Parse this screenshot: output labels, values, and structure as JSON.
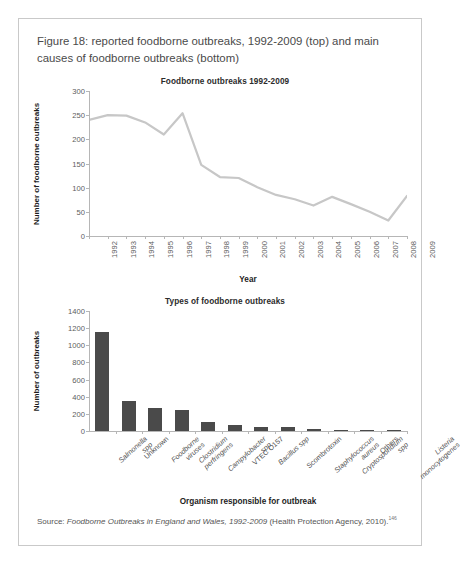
{
  "figure": {
    "caption": "Figure 18: reported foodborne outbreaks, 1992-2009 (top) and main causes of foodborne outbreaks (bottom)",
    "source_label": "Source: ",
    "source_title": "Foodborne Outbreaks in England and Wales, 1992-2009",
    "source_tail": " (Health Protection Agency, 2010).",
    "source_superscript": "146"
  },
  "colors": {
    "line": "#c7c7c7",
    "bar": "#4a4a4a",
    "axis": "#b6b6b6",
    "frame": "#c9c9c9",
    "text": "#3c3c3c"
  },
  "chart_data": [
    {
      "type": "line",
      "title": "Foodborne outbreaks 1992-2009",
      "xlabel": "Year",
      "ylabel": "Number of foodborne outbreaks",
      "ylim": [
        0,
        300
      ],
      "yticks": [
        0,
        50,
        100,
        150,
        200,
        250,
        300
      ],
      "grid": false,
      "legend": "none",
      "categories": [
        "1992",
        "1993",
        "1994",
        "1995",
        "1996",
        "1997",
        "1998",
        "1999",
        "2000",
        "2001",
        "2002",
        "2003",
        "2004",
        "2005",
        "2006",
        "2007",
        "2008",
        "2009"
      ],
      "values": [
        240,
        250,
        249,
        235,
        210,
        254,
        147,
        122,
        120,
        101,
        85,
        76,
        63,
        81,
        66,
        50,
        32,
        83
      ]
    },
    {
      "type": "bar",
      "title": "Types of foodborne outbreaks",
      "xlabel": "Organism responsible for outbreak",
      "ylabel": "Number of  outbreaks",
      "ylim": [
        0,
        1400
      ],
      "yticks": [
        0,
        200,
        400,
        600,
        800,
        1000,
        1200,
        1400
      ],
      "grid": false,
      "legend": "none",
      "categories": [
        "Salmonella spp",
        "Unknown",
        "Foodborne viruses",
        "Clostridium perfringens",
        "Campylobacter spp",
        "VTEC O157",
        "Bacillus spp",
        "Scombrotoxin",
        "Staphylococcus aureus",
        "Cryptosporidium spp",
        "Others",
        "Listeria monocytogenes"
      ],
      "category_lines": [
        [
          "Salmonella",
          "spp"
        ],
        [
          "Unknown"
        ],
        [
          "Foodborne",
          "viruses"
        ],
        [
          "Clostridium",
          "perfringens"
        ],
        [
          "Campylobacter",
          "spp"
        ],
        [
          "VTEC O157"
        ],
        [
          "Bacillus spp"
        ],
        [
          "Scombrotoxin"
        ],
        [
          "Staphylococcus",
          "aureus"
        ],
        [
          "Cryptosporidium",
          "spp"
        ],
        [
          "Others"
        ],
        [
          "Listeria",
          "monocytogenes"
        ]
      ],
      "values": [
        1150,
        355,
        270,
        240,
        100,
        70,
        45,
        45,
        18,
        15,
        12,
        8
      ]
    }
  ]
}
